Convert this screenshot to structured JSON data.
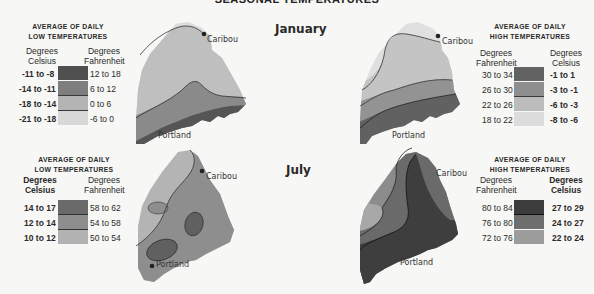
{
  "title": "SEASONAL TEMPERATURES",
  "months": {
    "january": "January",
    "july": "July"
  },
  "cities": {
    "north": "Caribou",
    "south": "Portland"
  },
  "colors": {
    "darkest": "#505050",
    "dark": "#7e7e7e",
    "medium": "#a8a8a8",
    "light": "#cfcfcf",
    "lightest": "#e4e4e4",
    "background": "#f7f7f5"
  },
  "legends": {
    "jan_low": {
      "heading_line1": "AVERAGE OF DAILY",
      "heading_line2": "LOW TEMPERATURES",
      "left_header_1": "Degrees",
      "left_header_2": "Celsius",
      "right_header_1": "Degrees",
      "right_header_2": "Fahrenheit",
      "rows": [
        {
          "celsius": "-11 to -8",
          "fahrenheit": "12 to 18"
        },
        {
          "celsius": "-14 to -11",
          "fahrenheit": "6 to 12"
        },
        {
          "celsius": "-18 to -14",
          "fahrenheit": "0 to 6"
        },
        {
          "celsius": "-21 to -18",
          "fahrenheit": "-6 to 0"
        }
      ]
    },
    "jan_high": {
      "heading_line1": "AVERAGE OF DAILY",
      "heading_line2": "HIGH TEMPERATURES",
      "left_header_1": "Degrees",
      "left_header_2": "Fahrenheit",
      "right_header_1": "Degrees",
      "right_header_2": "Celsius",
      "rows": [
        {
          "fahrenheit": "30 to 34",
          "celsius": "-1 to 1"
        },
        {
          "fahrenheit": "26 to 30",
          "celsius": "-3 to -1"
        },
        {
          "fahrenheit": "22 to 26",
          "celsius": "-6 to -3"
        },
        {
          "fahrenheit": "18 to 22",
          "celsius": "-8 to -6"
        }
      ]
    },
    "jul_low": {
      "heading_line1": "AVERAGE OF DAILY",
      "heading_line2": "LOW TEMPERATURES",
      "left_header_1": "Degrees",
      "left_header_2": "Celsius",
      "right_header_1": "Degrees",
      "right_header_2": "Fahrenheit",
      "rows": [
        {
          "celsius": "14 to 17",
          "fahrenheit": "58 to 62"
        },
        {
          "celsius": "12 to 14",
          "fahrenheit": "54 to 58"
        },
        {
          "celsius": "10 to 12",
          "fahrenheit": "50 to 54"
        }
      ]
    },
    "jul_high": {
      "heading_line1": "AVERAGE OF DAILY",
      "heading_line2": "HIGH TEMPERATURES",
      "left_header_1": "Degrees",
      "left_header_2": "Fahrenheit",
      "right_header_1": "Degrees",
      "right_header_2": "Celsius",
      "rows": [
        {
          "fahrenheit": "80 to 84",
          "celsius": "27 to 29"
        },
        {
          "fahrenheit": "76 to 80",
          "celsius": "24 to 27"
        },
        {
          "fahrenheit": "72 to 76",
          "celsius": "22 to 24"
        }
      ]
    }
  }
}
